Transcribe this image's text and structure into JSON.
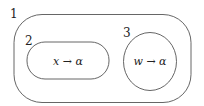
{
  "diagram": {
    "regions": [
      {
        "id": "1",
        "label": "1",
        "shape": "rounded-rect",
        "content": ""
      },
      {
        "id": "2",
        "label": "2",
        "shape": "rounded-rect",
        "content": "x → α"
      },
      {
        "id": "3",
        "label": "3",
        "shape": "ellipse",
        "content": "w → α"
      }
    ],
    "colors": {
      "stroke": "#555555",
      "text": "#222222",
      "background": "#ffffff"
    }
  }
}
